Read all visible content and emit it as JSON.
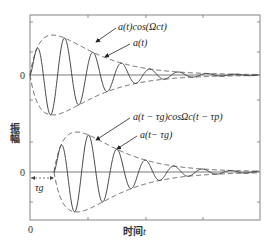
{
  "figure": {
    "ylabel": "振幅",
    "xlabel_prefix": "时间",
    "xlabel_var": "t",
    "x_origin_label": "0",
    "upper_zero_label": "0",
    "lower_zero_label": "0",
    "tau_g_label": "τg"
  },
  "annotations": {
    "upper_carrier": "a(t)cos(Ωct)",
    "upper_envelope": "a(t)",
    "lower_carrier": "a(t − τg)cosΩc(t − τp)",
    "lower_envelope": "a(t− τg)"
  },
  "chart_data": {
    "type": "line",
    "title": "",
    "xlabel": "时间t",
    "ylabel": "振幅",
    "grid": false,
    "panels": [
      {
        "name": "upper",
        "zero_label": "0",
        "series": [
          {
            "name": "a(t)cos(Ωct)",
            "style": "solid",
            "delay": 0
          },
          {
            "name": "a(t)",
            "style": "dashed",
            "delay": 0
          }
        ]
      },
      {
        "name": "lower",
        "zero_label": "0",
        "series": [
          {
            "name": "a(t − τg)cosΩc(t − τp)",
            "style": "solid",
            "delay": "τg"
          },
          {
            "name": "a(t− τg)",
            "style": "dashed",
            "delay": "τg"
          }
        ]
      }
    ],
    "envelope_model": "a(t) = A·(t/T0)·exp(1 − t/T0)-like rise then exponential decay",
    "x_ticks": [
      "0"
    ],
    "colors": {
      "line": "#333333",
      "axis": "#555555"
    }
  }
}
